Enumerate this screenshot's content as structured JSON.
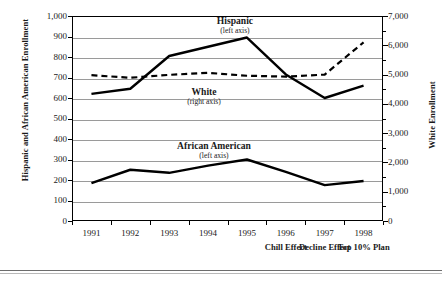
{
  "chart_data": {
    "type": "line",
    "title": "",
    "xlabel": "",
    "ylabel": "Hispanic and African American Enrollment",
    "y2label": "White Enrollment",
    "categories": [
      "1991",
      "1992",
      "1993",
      "1994",
      "1995",
      "1996",
      "1997",
      "1998"
    ],
    "x_annotations": [
      "",
      "",
      "",
      "",
      "",
      "Chill Effect",
      "Decline Effect",
      "Top 10% Plan"
    ],
    "ylim": [
      0,
      1000
    ],
    "y2lim": [
      0,
      7000
    ],
    "y_ticks": [
      "0",
      "100",
      "200",
      "300",
      "400",
      "500",
      "600",
      "700",
      "800",
      "900",
      "1,000"
    ],
    "y2_ticks": [
      "0",
      "1,000",
      "2,000",
      "3,000",
      "4,000",
      "5,000",
      "6,000",
      "7,000"
    ],
    "grid": true,
    "legend": "inline-annotations",
    "series": [
      {
        "name": "Hispanic",
        "axis_note": "(left axis)",
        "axis": "left",
        "style": "solid",
        "color": "#000000",
        "values": [
          620,
          645,
          805,
          850,
          895,
          715,
          600,
          660
        ]
      },
      {
        "name": "African American",
        "axis_note": "(left axis)",
        "axis": "left",
        "style": "solid",
        "color": "#000000",
        "values": [
          185,
          250,
          235,
          270,
          300,
          240,
          175,
          195
        ]
      },
      {
        "name": "White",
        "axis_note": "(right axis)",
        "axis": "right",
        "style": "dashed",
        "color": "#000000",
        "values": [
          4980,
          4890,
          4990,
          5060,
          4960,
          4930,
          5000,
          6100
        ]
      }
    ]
  }
}
